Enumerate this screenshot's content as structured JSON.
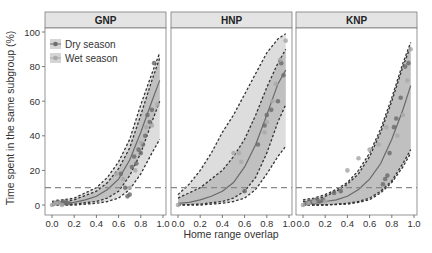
{
  "chart_data": {
    "type": "scatter",
    "title": "",
    "xlabel": "Home range overlap",
    "ylabel": "Time spent in the same subgroup (%)",
    "xlim": [
      0,
      1
    ],
    "ylim": [
      0,
      100
    ],
    "x_ticks": [
      "0.0",
      "0.2",
      "0.4",
      "0.6",
      "0.8",
      "1.0"
    ],
    "y_ticks": [
      "0",
      "20",
      "40",
      "60",
      "80",
      "100"
    ],
    "threshold_line": 10,
    "grid": false,
    "legend": {
      "position": "top-left inside first panel",
      "entries": [
        {
          "label": "Dry season",
          "color": "#6e6e6e"
        },
        {
          "label": "Wet season",
          "color": "#a9a9a9"
        }
      ]
    },
    "panels": [
      {
        "label": "GNP",
        "fit": {
          "x": [
            0,
            0.1,
            0.2,
            0.3,
            0.4,
            0.5,
            0.6,
            0.7,
            0.8,
            0.9,
            0.97
          ],
          "y": [
            0.5,
            1,
            1.5,
            3,
            5,
            9,
            15,
            26,
            42,
            60,
            72
          ]
        },
        "ci_inner_upper": {
          "x": [
            0,
            0.2,
            0.4,
            0.5,
            0.6,
            0.7,
            0.8,
            0.9,
            0.97
          ],
          "y": [
            1,
            3,
            8,
            13,
            21,
            33,
            52,
            72,
            85
          ]
        },
        "ci_inner_lower": {
          "x": [
            0,
            0.2,
            0.4,
            0.5,
            0.6,
            0.7,
            0.8,
            0.9,
            0.97
          ],
          "y": [
            0,
            0.5,
            2,
            4,
            8,
            17,
            30,
            48,
            60
          ]
        },
        "ci_outer_upper": {
          "x": [
            0,
            0.2,
            0.4,
            0.5,
            0.6,
            0.7,
            0.8,
            0.9,
            0.97
          ],
          "y": [
            2,
            4,
            10,
            16,
            25,
            38,
            58,
            76,
            88
          ]
        },
        "ci_outer_lower": {
          "x": [
            0,
            0.2,
            0.4,
            0.5,
            0.6,
            0.7,
            0.8,
            0.9,
            0.97
          ],
          "y": [
            0,
            0,
            1,
            2,
            4,
            9,
            18,
            30,
            38
          ]
        },
        "series": [
          {
            "name": "Dry season",
            "points": [
              [
                0.02,
                1
              ],
              [
                0.05,
                2
              ],
              [
                0.08,
                1
              ],
              [
                0.1,
                2
              ],
              [
                0.12,
                1
              ],
              [
                0.15,
                1
              ],
              [
                0.62,
                18
              ],
              [
                0.66,
                10
              ],
              [
                0.68,
                5
              ],
              [
                0.7,
                6
              ],
              [
                0.72,
                22
              ],
              [
                0.74,
                28
              ],
              [
                0.76,
                24
              ],
              [
                0.78,
                32
              ],
              [
                0.8,
                30
              ],
              [
                0.82,
                35
              ],
              [
                0.84,
                40
              ],
              [
                0.86,
                52
              ],
              [
                0.88,
                48
              ],
              [
                0.9,
                55
              ],
              [
                0.92,
                82
              ]
            ]
          },
          {
            "name": "Wet season",
            "points": [
              [
                0.0,
                0
              ],
              [
                0.03,
                1
              ],
              [
                0.06,
                1
              ],
              [
                0.09,
                0
              ],
              [
                0.58,
                18
              ],
              [
                0.64,
                15
              ],
              [
                0.7,
                10
              ],
              [
                0.75,
                20
              ],
              [
                0.8,
                36
              ],
              [
                0.85,
                45
              ],
              [
                0.9,
                46
              ],
              [
                0.95,
                58
              ]
            ]
          }
        ]
      },
      {
        "label": "HNP",
        "fit": {
          "x": [
            0,
            0.1,
            0.2,
            0.3,
            0.4,
            0.5,
            0.6,
            0.7,
            0.8,
            0.9,
            0.97
          ],
          "y": [
            1,
            1.5,
            3,
            5,
            8,
            13,
            22,
            35,
            52,
            70,
            78
          ]
        },
        "ci_inner_upper": {
          "x": [
            0,
            0.2,
            0.4,
            0.5,
            0.6,
            0.7,
            0.8,
            0.9,
            0.97
          ],
          "y": [
            4,
            10,
            20,
            28,
            38,
            52,
            68,
            82,
            90
          ]
        },
        "ci_inner_lower": {
          "x": [
            0,
            0.2,
            0.4,
            0.5,
            0.6,
            0.7,
            0.8,
            0.9,
            0.97
          ],
          "y": [
            0,
            0.5,
            2,
            4,
            8,
            16,
            30,
            48,
            58
          ]
        },
        "ci_outer_upper": {
          "x": [
            0,
            0.1,
            0.2,
            0.3,
            0.4,
            0.5,
            0.6,
            0.7,
            0.8,
            0.9,
            0.97
          ],
          "y": [
            6,
            12,
            20,
            30,
            42,
            52,
            64,
            76,
            88,
            96,
            99
          ]
        },
        "ci_outer_lower": {
          "x": [
            0,
            0.2,
            0.4,
            0.5,
            0.6,
            0.7,
            0.8,
            0.9,
            0.97
          ],
          "y": [
            0,
            0,
            1,
            2,
            4,
            9,
            18,
            28,
            34
          ]
        },
        "series": [
          {
            "name": "Dry season",
            "points": [
              [
                0.6,
                8
              ],
              [
                0.72,
                35
              ],
              [
                0.78,
                46
              ],
              [
                0.8,
                52
              ],
              [
                0.84,
                55
              ],
              [
                0.9,
                60
              ],
              [
                0.93,
                82
              ],
              [
                0.95,
                75
              ]
            ]
          },
          {
            "name": "Wet season",
            "points": [
              [
                0.0,
                0
              ],
              [
                0.5,
                30
              ],
              [
                0.55,
                30
              ],
              [
                0.57,
                25
              ],
              [
                0.78,
                42
              ],
              [
                0.8,
                48
              ],
              [
                0.85,
                60
              ],
              [
                0.88,
                70
              ],
              [
                0.92,
                84
              ],
              [
                0.97,
                95
              ]
            ]
          }
        ]
      },
      {
        "label": "KNP",
        "fit": {
          "x": [
            0,
            0.1,
            0.2,
            0.3,
            0.4,
            0.5,
            0.6,
            0.7,
            0.8,
            0.9,
            0.97
          ],
          "y": [
            0.5,
            1,
            2,
            3,
            5,
            9,
            15,
            24,
            38,
            55,
            69
          ]
        },
        "ci_inner_upper": {
          "x": [
            0,
            0.1,
            0.2,
            0.3,
            0.4,
            0.5,
            0.6,
            0.7,
            0.8,
            0.9,
            0.97
          ],
          "y": [
            2,
            3,
            5,
            8,
            12,
            18,
            28,
            42,
            60,
            80,
            92
          ]
        },
        "ci_inner_lower": {
          "x": [
            0,
            0.2,
            0.4,
            0.5,
            0.6,
            0.7,
            0.8,
            0.9,
            0.97
          ],
          "y": [
            0,
            0,
            1,
            2,
            4,
            8,
            14,
            24,
            32
          ]
        },
        "ci_outer_upper": {
          "x": [
            0,
            0.1,
            0.2,
            0.3,
            0.4,
            0.5,
            0.6,
            0.7,
            0.8,
            0.9,
            0.97
          ],
          "y": [
            3,
            4,
            6,
            9,
            13,
            20,
            30,
            44,
            62,
            82,
            94
          ]
        },
        "ci_outer_lower": {
          "x": [
            0,
            0.2,
            0.4,
            0.5,
            0.6,
            0.7,
            0.8,
            0.9,
            0.97
          ],
          "y": [
            0,
            0,
            0.5,
            1.5,
            3,
            7,
            13,
            22,
            30
          ]
        },
        "series": [
          {
            "name": "Dry season",
            "points": [
              [
                0.03,
                1
              ],
              [
                0.06,
                2
              ],
              [
                0.09,
                2
              ],
              [
                0.12,
                3
              ],
              [
                0.15,
                2
              ],
              [
                0.18,
                3
              ],
              [
                0.28,
                7
              ],
              [
                0.34,
                8
              ],
              [
                0.72,
                12
              ],
              [
                0.74,
                15
              ],
              [
                0.76,
                17
              ],
              [
                0.78,
                30
              ],
              [
                0.82,
                45
              ],
              [
                0.84,
                50
              ],
              [
                0.88,
                62
              ],
              [
                0.92,
                80
              ],
              [
                0.95,
                82
              ]
            ]
          },
          {
            "name": "Wet season",
            "points": [
              [
                0.0,
                0
              ],
              [
                0.05,
                1
              ],
              [
                0.1,
                2
              ],
              [
                0.2,
                2
              ],
              [
                0.4,
                20
              ],
              [
                0.5,
                27
              ],
              [
                0.6,
                32
              ],
              [
                0.68,
                35
              ],
              [
                0.75,
                45
              ],
              [
                0.85,
                40
              ],
              [
                0.9,
                52
              ],
              [
                0.94,
                72
              ],
              [
                0.97,
                90
              ]
            ]
          }
        ]
      }
    ]
  },
  "colors": {
    "strip_bg": "#e4e4e4",
    "panel_border": "#7a7a7a",
    "ribbon_inner": "#bdbdbd",
    "ribbon_outer": "#d9d9d9",
    "fit_line": "#6a6a6a",
    "dashed": "#333333",
    "threshold": "#888888",
    "dry": "#6e6e6e",
    "wet": "#a9a9a9",
    "text": "#333333"
  }
}
